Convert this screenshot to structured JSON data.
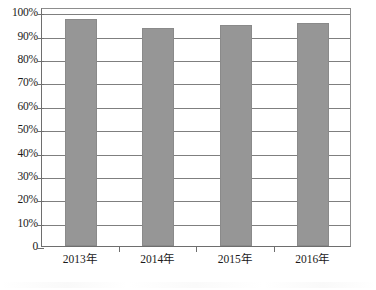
{
  "chart_data": {
    "type": "bar",
    "title": "",
    "subtitle": "",
    "xlabel": "",
    "ylabel": "",
    "categories": [
      "2013年",
      "2014年",
      "2015年",
      "2016年"
    ],
    "values": [
      97,
      93.5,
      94.5,
      95.5
    ],
    "series": [
      {
        "name": "",
        "values": [
          97,
          93.5,
          94.5,
          95.5
        ]
      }
    ],
    "ylim": [
      0,
      100
    ],
    "ytick_values": [
      100,
      90,
      80,
      70,
      60,
      50,
      40,
      30,
      20,
      10,
      0
    ],
    "ytick_labels": [
      "100%",
      "90%",
      "80%",
      "70%",
      "60%",
      "50%",
      "40%",
      "30%",
      "20%",
      "10%",
      "0"
    ],
    "grid": true,
    "grid_axis": "y",
    "legend": false,
    "legend_position": "none",
    "annotations": [],
    "colors": {
      "bar_fill": "#969696",
      "bar_stroke": "#8a8a8a",
      "gridline": "#7f7f7f",
      "axis": "#6e6e6e",
      "text": "#1a1a1a",
      "background": "#ffffff"
    }
  }
}
